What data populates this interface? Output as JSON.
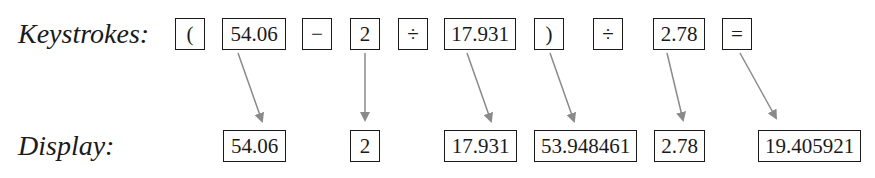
{
  "keystrokes": {
    "label": "Keystrokes:",
    "keys": [
      "(",
      "54.06",
      "−",
      "2",
      "÷",
      "17.931",
      ")",
      "÷",
      "2.78",
      "="
    ]
  },
  "display": {
    "label": "Display:",
    "values": [
      "54.06",
      "2",
      "17.931",
      "53.948461",
      "2.78",
      "19.405921"
    ]
  },
  "arrows": [
    {
      "from_key": 1,
      "to_display": 0
    },
    {
      "from_key": 3,
      "to_display": 1
    },
    {
      "from_key": 5,
      "to_display": 2
    },
    {
      "from_key": 6,
      "to_display": 3
    },
    {
      "from_key": 8,
      "to_display": 4
    },
    {
      "from_key": 9,
      "to_display": 5
    }
  ],
  "colors": {
    "arrow": "#8a8a8a",
    "box_border": "#1a1a1a",
    "text": "#1a1a1a"
  }
}
